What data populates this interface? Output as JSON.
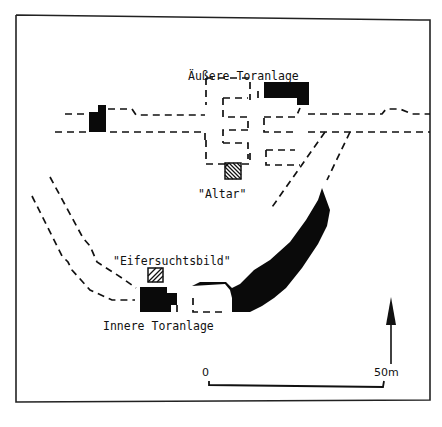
{
  "diagram": {
    "type": "archaeological site plan",
    "labels": {
      "outer_gate": "Äußere Toranlage",
      "altar": "\"Altar\"",
      "jealousy_image": "\"Eifersuchtsbild\"",
      "inner_gate": "Innere Toranlage"
    },
    "scale_bar": {
      "start_label": "0",
      "end_label": "50m"
    },
    "north_arrow": {
      "name": "north-arrow"
    },
    "legend": {
      "solid_black": "excavated walls",
      "dashed": "reconstructed outline",
      "hatched": "platform / installation"
    },
    "colors": {
      "ink": "#111111",
      "paper": "#ffffff"
    }
  }
}
